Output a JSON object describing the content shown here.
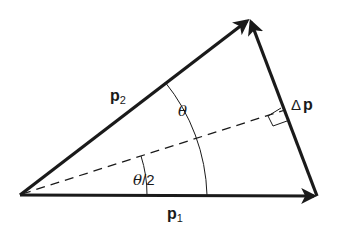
{
  "diagram": {
    "vectors": [
      {
        "id": "p1",
        "label_main": "p",
        "label_sub": "1",
        "from": [
          20,
          195
        ],
        "to": [
          317,
          196
        ]
      },
      {
        "id": "p2",
        "label_main": "p",
        "label_sub": "2",
        "from": [
          20,
          195
        ],
        "to": [
          250,
          18
        ]
      },
      {
        "id": "delta_p",
        "label_prefix": "Δ",
        "label_main": "p",
        "from": [
          317,
          196
        ],
        "to": [
          250,
          18
        ]
      }
    ],
    "bisector": {
      "style": "dashed",
      "from": [
        20,
        195
      ],
      "to": [
        285,
        110
      ]
    },
    "angles": {
      "theta": {
        "label": "θ"
      },
      "half_theta": {
        "label_theta": "θ",
        "label_rest": "/2"
      }
    },
    "right_angle_marker": true,
    "colors": {
      "stroke": "#1a1a1a",
      "background": "#ffffff"
    }
  }
}
